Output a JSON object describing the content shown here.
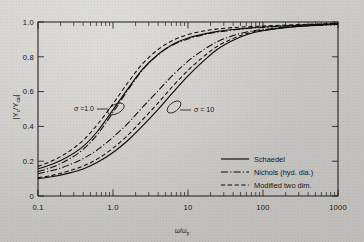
{
  "figure": {
    "background_color": "#c9c8c4",
    "ink_color": "#0d0d0d"
  },
  "chart_data": {
    "type": "line",
    "title": "",
    "subtitle": "",
    "xlabel": "ω/ω",
    "xlabel_sub": "p",
    "ylabel": "|Y/Y|",
    "ylabel_parts": {
      "bar_left": "|",
      "num": "Y",
      "num_sub": "c",
      "slash": "/",
      "den": "Y",
      "den_sub": "cal",
      "bar_right": "|"
    },
    "xscale": "log",
    "yscale": "linear",
    "xlim": [
      0.1,
      1000
    ],
    "ylim": [
      0,
      1.0
    ],
    "grid": false,
    "x_tick_labels": [
      "0.1",
      "1.0",
      "10",
      "100",
      "1000"
    ],
    "x_tick_values": [
      0.1,
      1,
      10,
      100,
      1000
    ],
    "y_tick_labels": [
      "0",
      "0.2",
      "0.4",
      "0.6",
      "0.8",
      "1.0"
    ],
    "y_tick_values": [
      0,
      0.2,
      0.4,
      0.6,
      0.8,
      1.0
    ],
    "legend_position": "lower right",
    "legend": [
      {
        "label": "Schaedel",
        "style": "solid"
      },
      {
        "label": "Nichols (hyd. dia.)",
        "style": "dash-dot"
      },
      {
        "label": "Modified  two dim.",
        "style": "dashed"
      }
    ],
    "annotations": [
      {
        "text": "σ =1.0",
        "x": 1.0,
        "y": 0.5,
        "group": "sigma-1"
      },
      {
        "text": "σ = 10",
        "x": 10.0,
        "y": 0.5,
        "group": "sigma-10"
      }
    ],
    "series": [
      {
        "name": "Schaedel, σ = 1.0",
        "group": "sigma-1",
        "style": "solid",
        "x": [
          0.1,
          0.16,
          0.25,
          0.4,
          0.63,
          1.0,
          1.6,
          2.5,
          4.0,
          6.3,
          10,
          16,
          25,
          40,
          63,
          100,
          250,
          1000
        ],
        "y": [
          0.155,
          0.185,
          0.225,
          0.285,
          0.375,
          0.495,
          0.62,
          0.73,
          0.815,
          0.872,
          0.908,
          0.93,
          0.946,
          0.957,
          0.965,
          0.971,
          0.98,
          0.99
        ]
      },
      {
        "name": "Nichols (hyd. dia.), σ = 1.0",
        "group": "sigma-1",
        "style": "dash-dot",
        "x": [
          0.1,
          0.16,
          0.25,
          0.4,
          0.63,
          1.0,
          1.6,
          2.5,
          4.0,
          6.3,
          10,
          16,
          25,
          40,
          63,
          100,
          250,
          1000
        ],
        "y": [
          0.14,
          0.168,
          0.208,
          0.268,
          0.358,
          0.48,
          0.612,
          0.726,
          0.812,
          0.868,
          0.903,
          0.926,
          0.942,
          0.954,
          0.963,
          0.969,
          0.979,
          0.989
        ]
      },
      {
        "name": "Modified two dim., σ = 1.0",
        "group": "sigma-1",
        "style": "dashed",
        "x": [
          0.1,
          0.16,
          0.25,
          0.4,
          0.63,
          1.0,
          1.6,
          2.5,
          4.0,
          6.3,
          10,
          16,
          25,
          40,
          63,
          100,
          250,
          1000
        ],
        "y": [
          0.17,
          0.205,
          0.252,
          0.32,
          0.415,
          0.53,
          0.655,
          0.762,
          0.842,
          0.895,
          0.928,
          0.948,
          0.96,
          0.968,
          0.973,
          0.977,
          0.984,
          0.992
        ]
      },
      {
        "name": "Schaedel, σ = 10",
        "group": "sigma-10",
        "style": "solid",
        "x": [
          0.1,
          0.16,
          0.25,
          0.4,
          0.63,
          1.0,
          1.6,
          2.5,
          4.0,
          6.3,
          10,
          16,
          25,
          40,
          63,
          100,
          250,
          1000
        ],
        "y": [
          0.1,
          0.112,
          0.13,
          0.155,
          0.195,
          0.25,
          0.322,
          0.405,
          0.498,
          0.595,
          0.69,
          0.775,
          0.845,
          0.895,
          0.93,
          0.95,
          0.972,
          0.988
        ]
      },
      {
        "name": "Nichols (hyd. dia.), σ = 10",
        "group": "sigma-10",
        "style": "dash-dot",
        "x": [
          0.1,
          0.16,
          0.25,
          0.4,
          0.63,
          1.0,
          1.6,
          2.5,
          4.0,
          6.3,
          10,
          16,
          25,
          40,
          63,
          100,
          250,
          1000
        ],
        "y": [
          0.128,
          0.148,
          0.176,
          0.215,
          0.268,
          0.338,
          0.42,
          0.512,
          0.605,
          0.695,
          0.775,
          0.84,
          0.888,
          0.922,
          0.944,
          0.957,
          0.973,
          0.988
        ]
      },
      {
        "name": "Modified two dim., σ = 10",
        "group": "sigma-10",
        "style": "dashed",
        "x": [
          0.1,
          0.16,
          0.25,
          0.4,
          0.63,
          1.0,
          1.6,
          2.5,
          4.0,
          6.3,
          10,
          16,
          25,
          40,
          63,
          100,
          250,
          1000
        ],
        "y": [
          0.105,
          0.12,
          0.142,
          0.172,
          0.215,
          0.275,
          0.352,
          0.44,
          0.535,
          0.632,
          0.722,
          0.8,
          0.862,
          0.906,
          0.936,
          0.953,
          0.973,
          0.989
        ]
      }
    ]
  }
}
